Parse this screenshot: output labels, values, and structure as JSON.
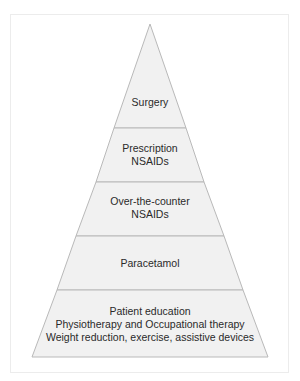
{
  "diagram": {
    "type": "pyramid",
    "colors": {
      "fill": "#f1f1f1",
      "stroke": "#b9b9b9",
      "text": "#2a2a2a",
      "frame": "#ececec"
    },
    "layers": [
      {
        "id": "surgery",
        "lines": [
          "Surgery"
        ]
      },
      {
        "id": "prescription-nsaids",
        "lines": [
          "Prescription",
          "NSAIDs"
        ]
      },
      {
        "id": "otc-nsaids",
        "lines": [
          "Over-the-counter",
          "NSAIDs"
        ]
      },
      {
        "id": "paracetamol",
        "lines": [
          "Paracetamol"
        ]
      },
      {
        "id": "foundation",
        "lines": [
          "Patient education",
          "Physiotherapy and Occupational therapy",
          "Weight reduction, exercise, assistive devices"
        ]
      }
    ]
  }
}
